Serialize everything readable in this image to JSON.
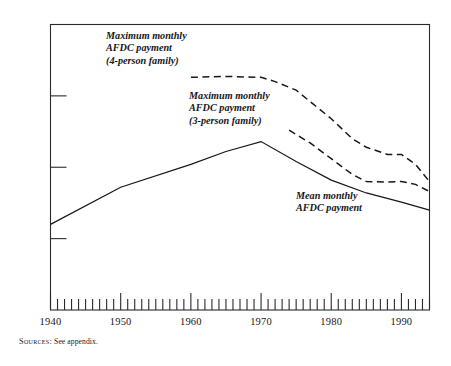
{
  "figure": {
    "source_note_label": "Sources:",
    "source_note_text": " See appendix."
  },
  "chart_data": {
    "type": "line",
    "title": "",
    "xlabel": "",
    "ylabel": "",
    "xlim": [
      1940,
      1994
    ],
    "ylim": [
      0,
      1000
    ],
    "grid": false,
    "legend_position": "inline-annotations",
    "y_ticks": [
      0,
      250,
      500,
      750,
      1000
    ],
    "y_tick_labels": [
      "0",
      "250",
      "500",
      "750",
      "1,000"
    ],
    "x_ticks": [
      1940,
      1950,
      1960,
      1970,
      1980,
      1990
    ],
    "x_tick_labels": [
      "1940",
      "1950",
      "1960",
      "1970",
      "1980",
      "1990"
    ],
    "x_minor_tick_interval": 1,
    "series": [
      {
        "name": "Maximum monthly AFDC payment (4-person family)",
        "annotation_lines": [
          "Maximum monthly",
          "AFDC payment",
          "(4-person family)"
        ],
        "style": "dashed",
        "color": "#17161a",
        "x": [
          1960,
          1965,
          1970,
          1972,
          1975,
          1977,
          1980,
          1983,
          1985,
          1988,
          1990,
          1992,
          1994
        ],
        "values": [
          815,
          818,
          815,
          800,
          770,
          730,
          670,
          600,
          570,
          545,
          545,
          510,
          450
        ]
      },
      {
        "name": "Maximum monthly AFDC payment (3-person family)",
        "annotation_lines": [
          "Maximum monthly",
          "AFDC payment",
          "(3-person family)"
        ],
        "style": "dashed",
        "color": "#17161a",
        "x": [
          1974,
          1977,
          1980,
          1983,
          1985,
          1988,
          1990,
          1992,
          1994
        ],
        "values": [
          630,
          585,
          530,
          475,
          450,
          448,
          450,
          440,
          415
        ]
      },
      {
        "name": "Mean monthly AFDC payment",
        "annotation_lines": [
          "Mean monthly",
          "AFDC payment"
        ],
        "style": "solid",
        "color": "#17161a",
        "x": [
          1940,
          1950,
          1960,
          1965,
          1970,
          1975,
          1980,
          1985,
          1990,
          1994
        ],
        "values": [
          300,
          430,
          510,
          555,
          590,
          520,
          455,
          410,
          378,
          350
        ]
      }
    ]
  }
}
